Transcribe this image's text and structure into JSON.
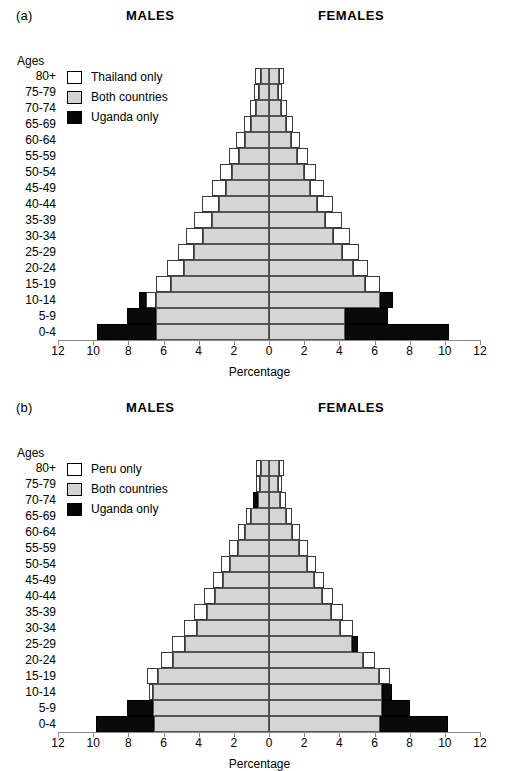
{
  "panels": [
    {
      "letter": "(a)",
      "males_label": "MALES",
      "females_label": "FEMALES",
      "ages_title": "Ages",
      "legend": [
        {
          "key": "only",
          "label": "Thailand only",
          "color": "#ffffff"
        },
        {
          "key": "both",
          "label": "Both countries",
          "color": "#d5d5d5"
        },
        {
          "key": "uganda",
          "label": "Uganda only",
          "color": "#0a0a0a"
        }
      ],
      "xaxis_title": "Percentage",
      "xticks": [
        12,
        10,
        8,
        6,
        4,
        2,
        0,
        2,
        4,
        6,
        8,
        10,
        12
      ],
      "chart_data": {
        "type": "bar",
        "subtype": "population-pyramid",
        "title": "(a) Thailand and Uganda age structure comparison",
        "xlabel": "Percentage",
        "ylabel": "Ages",
        "xlim": [
          -12,
          12
        ],
        "grid": false,
        "legend_position": "top-left",
        "categories": [
          "80+",
          "75-79",
          "70-74",
          "65-69",
          "60-64",
          "55-59",
          "50-54",
          "45-49",
          "40-44",
          "35-39",
          "30-34",
          "25-29",
          "20-24",
          "15-19",
          "10-14",
          "5-9",
          "0-4"
        ],
        "series": [
          {
            "name": "Males both countries",
            "side": "left",
            "values": [
              0.45,
              0.55,
              0.75,
              1.05,
              1.35,
              1.7,
              2.1,
              2.45,
              2.85,
              3.25,
              3.75,
              4.25,
              4.85,
              5.55,
              6.45,
              6.45,
              6.45
            ]
          },
          {
            "name": "Males country-only",
            "side": "left",
            "values": [
              0.35,
              0.3,
              0.35,
              0.4,
              0.55,
              0.6,
              0.7,
              0.8,
              0.95,
              1.0,
              0.95,
              0.95,
              0.95,
              0.9,
              0.55,
              0.0,
              0.0
            ]
          },
          {
            "name": "Males Uganda only",
            "side": "left",
            "values": [
              0.0,
              0.0,
              0.0,
              0.0,
              0.0,
              0.0,
              0.0,
              0.0,
              0.0,
              0.0,
              0.0,
              0.0,
              0.0,
              0.0,
              0.4,
              1.6,
              3.35
            ]
          },
          {
            "name": "Females both countries",
            "side": "right",
            "values": [
              0.55,
              0.5,
              0.7,
              0.95,
              1.25,
              1.6,
              2.0,
              2.35,
              2.75,
              3.2,
              3.65,
              4.15,
              4.75,
              5.45,
              6.3,
              4.35,
              4.35
            ]
          },
          {
            "name": "Females country-only",
            "side": "right",
            "values": [
              0.3,
              0.25,
              0.3,
              0.4,
              0.5,
              0.6,
              0.7,
              0.8,
              0.9,
              0.95,
              0.95,
              0.95,
              0.9,
              0.85,
              0.0,
              0.0,
              0.0
            ]
          },
          {
            "name": "Females Uganda only",
            "side": "right",
            "values": [
              0.0,
              0.0,
              0.0,
              0.0,
              0.0,
              0.0,
              0.0,
              0.0,
              0.0,
              0.0,
              0.0,
              0.0,
              0.0,
              0.0,
              0.75,
              2.4,
              5.9
            ]
          }
        ]
      }
    },
    {
      "letter": "(b)",
      "males_label": "MALES",
      "females_label": "FEMALES",
      "ages_title": "Ages",
      "legend": [
        {
          "key": "only",
          "label": "Peru only",
          "color": "#ffffff"
        },
        {
          "key": "both",
          "label": "Both countries",
          "color": "#d5d5d5"
        },
        {
          "key": "uganda",
          "label": "Uganda only",
          "color": "#0a0a0a"
        }
      ],
      "xaxis_title": "Percentage",
      "xticks": [
        12,
        10,
        8,
        6,
        4,
        2,
        0,
        2,
        4,
        6,
        8,
        10,
        12
      ],
      "chart_data": {
        "type": "bar",
        "subtype": "population-pyramid",
        "title": "(b) Peru and Uganda age structure comparison",
        "xlabel": "Percentage",
        "ylabel": "Ages",
        "xlim": [
          -12,
          12
        ],
        "grid": false,
        "legend_position": "top-left",
        "categories": [
          "80+",
          "75-79",
          "70-74",
          "65-69",
          "60-64",
          "55-59",
          "50-54",
          "45-49",
          "40-44",
          "35-39",
          "30-34",
          "25-29",
          "20-24",
          "15-19",
          "10-14",
          "5-9",
          "0-4"
        ],
        "series": [
          {
            "name": "Males both countries",
            "side": "left",
            "values": [
              0.45,
              0.5,
              0.6,
              1.0,
              1.35,
              1.75,
              2.2,
              2.6,
              3.05,
              3.55,
              4.1,
              4.8,
              5.45,
              6.3,
              6.6,
              6.6,
              6.55
            ]
          },
          {
            "name": "Males country-only",
            "side": "left",
            "values": [
              0.3,
              0.25,
              0.0,
              0.3,
              0.4,
              0.5,
              0.55,
              0.6,
              0.65,
              0.7,
              0.75,
              0.7,
              0.7,
              0.65,
              0.25,
              0.0,
              0.0
            ]
          },
          {
            "name": "Males Uganda only",
            "side": "left",
            "values": [
              0.0,
              0.0,
              0.3,
              0.0,
              0.0,
              0.0,
              0.0,
              0.0,
              0.0,
              0.0,
              0.0,
              0.0,
              0.0,
              0.0,
              0.0,
              1.45,
              3.3
            ]
          },
          {
            "name": "Females both countries",
            "side": "right",
            "values": [
              0.55,
              0.5,
              0.65,
              0.95,
              1.3,
              1.7,
              2.15,
              2.55,
              3.0,
              3.5,
              4.05,
              4.7,
              5.35,
              6.25,
              6.45,
              6.45,
              6.3
            ]
          },
          {
            "name": "Females country-only",
            "side": "right",
            "values": [
              0.3,
              0.25,
              0.3,
              0.35,
              0.45,
              0.5,
              0.55,
              0.6,
              0.65,
              0.7,
              0.75,
              0.0,
              0.7,
              0.65,
              0.0,
              0.0,
              0.0
            ]
          },
          {
            "name": "Females Uganda only",
            "side": "right",
            "values": [
              0.0,
              0.0,
              0.0,
              0.0,
              0.0,
              0.0,
              0.0,
              0.0,
              0.0,
              0.0,
              0.0,
              0.35,
              0.0,
              0.0,
              0.55,
              1.55,
              3.9
            ]
          }
        ]
      }
    }
  ]
}
